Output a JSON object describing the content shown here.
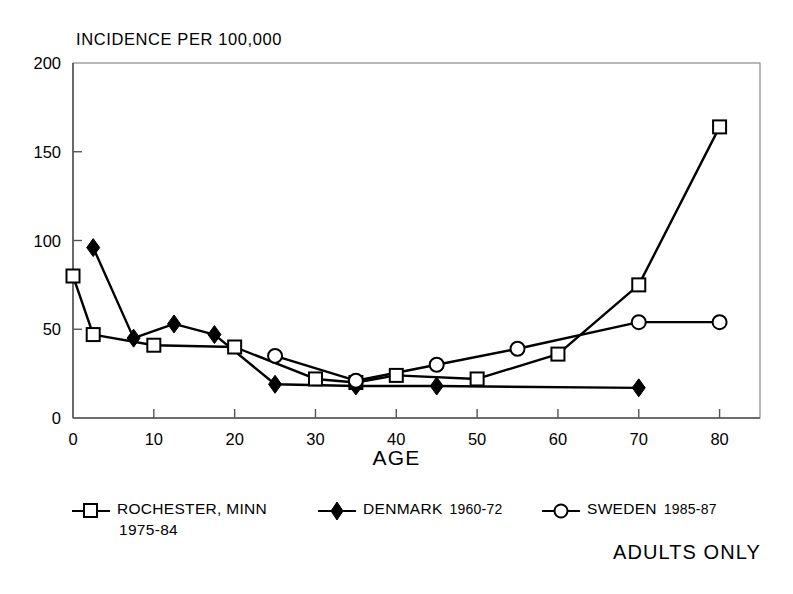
{
  "chart_data": {
    "type": "line",
    "title": "",
    "ylabel": "INCIDENCE PER 100,000",
    "xlabel": "AGE",
    "xlim": [
      0,
      85
    ],
    "ylim": [
      0,
      200
    ],
    "xticks": [
      0,
      10,
      20,
      30,
      40,
      50,
      60,
      70,
      80
    ],
    "yticks": [
      0,
      50,
      100,
      150,
      200
    ],
    "grid": false,
    "legend_position": "bottom",
    "annotation": "ADULTS ONLY",
    "series": [
      {
        "name": "ROCHESTER, MINN",
        "years": "1975-84",
        "marker": "open-square",
        "x": [
          0,
          2.5,
          10,
          20,
          30,
          35,
          40,
          50,
          60,
          70,
          80
        ],
        "values": [
          80,
          47,
          41,
          40,
          22,
          20,
          24,
          22,
          36,
          75,
          164
        ]
      },
      {
        "name": "DENMARK",
        "years": "1960-72",
        "marker": "filled-diamond",
        "x": [
          2.5,
          7.5,
          12.5,
          17.5,
          25,
          35,
          45,
          70
        ],
        "values": [
          96,
          45,
          53,
          47,
          19,
          18,
          18,
          17
        ]
      },
      {
        "name": "SWEDEN",
        "years": "1985-87",
        "marker": "open-circle",
        "x": [
          25,
          35,
          45,
          55,
          70,
          80
        ],
        "values": [
          35,
          21,
          30,
          39,
          54,
          54
        ]
      }
    ]
  },
  "axes": {
    "y_title": "INCIDENCE PER 100,000",
    "x_title": "AGE",
    "y_tick_labels": [
      "0",
      "50",
      "100",
      "150",
      "200"
    ],
    "x_tick_labels": [
      "0",
      "10",
      "20",
      "30",
      "40",
      "50",
      "60",
      "70",
      "80"
    ]
  },
  "legend": {
    "entries": [
      {
        "name": "ROCHESTER, MINN",
        "years": "",
        "second_line": "1975-84",
        "marker": "open-square"
      },
      {
        "name": "DENMARK",
        "years": "1960-72",
        "second_line": "",
        "marker": "filled-diamond"
      },
      {
        "name": "SWEDEN",
        "years": "1985-87",
        "second_line": "",
        "marker": "open-circle"
      }
    ]
  },
  "footer": {
    "note": "ADULTS ONLY"
  },
  "colors": {
    "ink": "#000000",
    "background": "#ffffff"
  }
}
